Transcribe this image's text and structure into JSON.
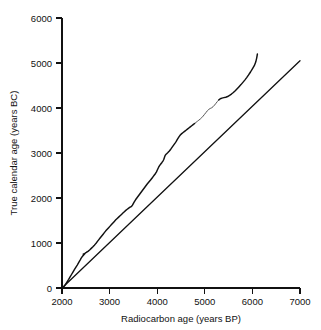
{
  "chart_data": {
    "type": "line",
    "title": "",
    "subtitle": "",
    "xlabel": "Radiocarbon age (years BP)",
    "ylabel": "True calendar age (years BC)",
    "xlim": [
      2000,
      7000
    ],
    "ylim": [
      0,
      6000
    ],
    "xticks": [
      2000,
      3000,
      4000,
      5000,
      6000,
      7000
    ],
    "yticks": [
      0,
      1000,
      2000,
      3000,
      4000,
      5000,
      6000
    ],
    "xtick_labels": [
      "2000",
      "3000",
      "4000",
      "5000",
      "6000",
      "7000"
    ],
    "ytick_labels": [
      "0",
      "1000",
      "2000",
      "3000",
      "4000",
      "5000",
      "6000"
    ],
    "grid": false,
    "legend": "none",
    "legend_position": "none",
    "colors": {
      "calibration_curve": "#111111",
      "calibration_curve_faint": "#555555",
      "reference_line": "#111111",
      "axis": "#111111",
      "background": "#ffffff"
    },
    "series": [
      {
        "name": "Radiocarbon calibration curve",
        "style": "solid-wiggly",
        "x": [
          2050,
          2080,
          2110,
          2140,
          2170,
          2200,
          2230,
          2260,
          2290,
          2320,
          2350,
          2380,
          2400,
          2420,
          2440,
          2455,
          2470,
          2480,
          2470,
          2455,
          2445,
          2455,
          2480,
          2510,
          2545,
          2580,
          2615,
          2650,
          2680,
          2700,
          2720,
          2745,
          2770,
          2800,
          2830,
          2860,
          2890,
          2920,
          2950,
          2980,
          3010,
          3040,
          3070,
          3100,
          3130,
          3160,
          3190,
          3220,
          3250,
          3280,
          3310,
          3340,
          3370,
          3395,
          3415,
          3430,
          3445,
          3460,
          3470,
          3480,
          3495,
          3515,
          3545,
          3580,
          3615,
          3650,
          3685,
          3720,
          3755,
          3790,
          3825,
          3860,
          3890,
          3915,
          3940,
          3965,
          3985,
          4000,
          4015,
          4030,
          4050,
          4075,
          4100,
          4120,
          4135,
          4145,
          4155,
          4165,
          4180,
          4200,
          4225,
          4255,
          4285,
          4315,
          4345,
          4375,
          4400,
          4420,
          4440,
          4460,
          4485,
          4515,
          4545,
          4575,
          4605,
          4635,
          4665,
          4695,
          4725,
          4755,
          4785,
          4815,
          4845,
          4875,
          4905,
          4935,
          4965,
          4995,
          5025,
          5055,
          5085,
          5115,
          5145,
          5175,
          5205,
          5235,
          5265,
          5295,
          5325,
          5360,
          5400,
          5440,
          5480,
          5520,
          5560,
          5600,
          5640,
          5680,
          5720,
          5760,
          5800,
          5840,
          5880,
          5920,
          5960,
          6000,
          6040,
          6070,
          6090,
          6105
        ],
        "y": [
          40,
          90,
          140,
          190,
          245,
          300,
          355,
          410,
          460,
          510,
          565,
          620,
          660,
          690,
          715,
          735,
          750,
          760,
          760,
          755,
          750,
          755,
          770,
          790,
          815,
          845,
          880,
          915,
          950,
          975,
          1000,
          1035,
          1070,
          1110,
          1150,
          1190,
          1230,
          1270,
          1305,
          1340,
          1375,
          1410,
          1445,
          1480,
          1515,
          1545,
          1575,
          1605,
          1635,
          1665,
          1695,
          1725,
          1750,
          1770,
          1785,
          1795,
          1805,
          1815,
          1825,
          1840,
          1870,
          1910,
          1960,
          2010,
          2060,
          2110,
          2160,
          2210,
          2260,
          2310,
          2355,
          2400,
          2440,
          2475,
          2510,
          2545,
          2580,
          2615,
          2650,
          2685,
          2720,
          2755,
          2790,
          2820,
          2850,
          2880,
          2910,
          2940,
          2965,
          2985,
          3010,
          3045,
          3085,
          3130,
          3175,
          3220,
          3260,
          3295,
          3330,
          3365,
          3400,
          3430,
          3455,
          3480,
          3505,
          3530,
          3555,
          3580,
          3605,
          3630,
          3655,
          3680,
          3705,
          3730,
          3755,
          3785,
          3820,
          3860,
          3900,
          3940,
          3970,
          3990,
          4005,
          4030,
          4065,
          4105,
          4145,
          4180,
          4205,
          4220,
          4230,
          4240,
          4255,
          4280,
          4310,
          4345,
          4385,
          4430,
          4475,
          4520,
          4570,
          4620,
          4675,
          4735,
          4800,
          4870,
          4940,
          5020,
          5110,
          5200
        ]
      },
      {
        "name": "Reference line",
        "style": "solid-straight",
        "x": [
          2000,
          7000
        ],
        "y": [
          0,
          5050
        ]
      }
    ]
  }
}
